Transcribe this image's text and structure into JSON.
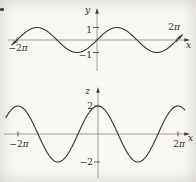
{
  "figure": {
    "background": "#f8f7f3",
    "ink_color": "#3a3a38",
    "axis_color": "#97948e",
    "text_color": "#30302d"
  },
  "chart_data": [
    {
      "id": "top",
      "type": "line",
      "function": "y = sin x",
      "fn": "sin",
      "amplitude": 1,
      "xlabel": "x",
      "ylabel": "y",
      "x_range_pi": [
        -2.13,
        2.14
      ],
      "curve_arrows": true,
      "x_ticks": [
        {
          "x_pi": -2,
          "label": "−2π",
          "side": "below"
        },
        {
          "x_pi": 2,
          "label": "2π",
          "side": "above"
        }
      ],
      "y_ticks": [
        {
          "y": 1,
          "label": "1"
        },
        {
          "y": -1,
          "label": "−1"
        }
      ],
      "key_points": {
        "x_pi": [
          -2,
          -1.5,
          -1,
          -0.5,
          0,
          0.5,
          1,
          1.5,
          2
        ],
        "y": [
          0,
          1,
          0,
          -1,
          0,
          1,
          0,
          -1,
          0
        ]
      }
    },
    {
      "id": "bottom",
      "type": "line",
      "function": "z = 2 cos x",
      "fn": "cos",
      "amplitude": 2,
      "xlabel": "x",
      "ylabel": "z",
      "x_range_pi": [
        -2.3,
        2.17
      ],
      "curve_arrows": false,
      "x_ticks": [
        {
          "x_pi": -2,
          "label": "−2π",
          "side": "below"
        },
        {
          "x_pi": 2,
          "label": "2π",
          "side": "below"
        }
      ],
      "y_ticks": [
        {
          "y": 2,
          "label": "2"
        },
        {
          "y": -2,
          "label": "−2"
        }
      ],
      "key_points": {
        "x_pi": [
          -2,
          -1.5,
          -1,
          -0.5,
          0,
          0.5,
          1,
          1.5,
          2
        ],
        "z": [
          2,
          0,
          -2,
          0,
          2,
          0,
          -2,
          0,
          2
        ]
      }
    }
  ]
}
